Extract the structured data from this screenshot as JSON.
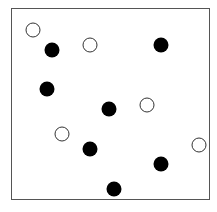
{
  "diagram": {
    "frame": {
      "x": 11,
      "y": 8,
      "width": 199,
      "height": 192,
      "stroke": "#555555"
    },
    "style": {
      "radius": 7.5,
      "filled_color": "#000000",
      "hollow_fill": "#ffffff",
      "hollow_stroke": "#333333"
    },
    "points": [
      {
        "x": 33,
        "y": 30,
        "type": "hollow"
      },
      {
        "x": 52,
        "y": 50,
        "type": "filled"
      },
      {
        "x": 90,
        "y": 45,
        "type": "hollow"
      },
      {
        "x": 161,
        "y": 45,
        "type": "filled"
      },
      {
        "x": 47,
        "y": 89,
        "type": "filled"
      },
      {
        "x": 109,
        "y": 109,
        "type": "filled"
      },
      {
        "x": 147,
        "y": 105,
        "type": "hollow"
      },
      {
        "x": 62,
        "y": 134,
        "type": "hollow"
      },
      {
        "x": 90,
        "y": 149,
        "type": "filled"
      },
      {
        "x": 199,
        "y": 145,
        "type": "hollow"
      },
      {
        "x": 161,
        "y": 164,
        "type": "filled"
      },
      {
        "x": 114,
        "y": 189,
        "type": "filled"
      }
    ],
    "counts": {
      "filled": 7,
      "hollow": 5
    }
  }
}
